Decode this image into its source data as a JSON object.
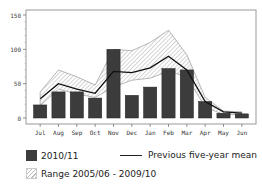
{
  "chart_data": {
    "type": "bar",
    "title": "",
    "xlabel": "",
    "ylabel": "",
    "ylim": [
      0,
      150
    ],
    "yticks": [
      "0",
      "50",
      "100",
      "150"
    ],
    "categories": [
      "Jul",
      "Aug",
      "Sep",
      "Oct",
      "Nov",
      "Dec",
      "Jan",
      "Feb",
      "Mar",
      "Apr",
      "May",
      "Jun"
    ],
    "series": [
      {
        "name": "2010/11",
        "type": "bar",
        "values": [
          19,
          38,
          38,
          29,
          100,
          33,
          45,
          72,
          70,
          24,
          7,
          6
        ]
      },
      {
        "name": "Previous five-year mean",
        "type": "line",
        "values": [
          28,
          50,
          42,
          36,
          68,
          66,
          73,
          90,
          70,
          24,
          9,
          7
        ]
      },
      {
        "name": "Range 2005/06 - 2009/10",
        "type": "area_range",
        "low": [
          18,
          42,
          35,
          30,
          45,
          55,
          58,
          68,
          60,
          16,
          5,
          5
        ],
        "high": [
          38,
          70,
          60,
          48,
          100,
          98,
          110,
          128,
          92,
          30,
          10,
          9
        ]
      }
    ],
    "grid": false,
    "legend_position": "bottom"
  },
  "legend": {
    "bar_label": "2010/11",
    "line_label": "Previous five-year mean",
    "range_label": "Range 2005/06 - 2009/10"
  }
}
